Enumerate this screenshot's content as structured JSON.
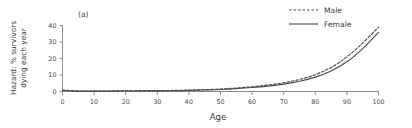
{
  "panel": {
    "label": "(a)"
  },
  "legend": {
    "position": "top-right",
    "entries": [
      {
        "label": "Male",
        "style": "dashed"
      },
      {
        "label": "Female",
        "style": "solid"
      }
    ]
  },
  "axes": {
    "x": {
      "title": "Age",
      "ticks": [
        "0",
        "10",
        "20",
        "30",
        "40",
        "50",
        "60",
        "70",
        "80",
        "90",
        "100"
      ],
      "min": 0,
      "max": 100
    },
    "y": {
      "title_line1": "Hazard: % survivors",
      "title_line2": "dying each year",
      "ticks": [
        "0",
        "10",
        "20",
        "30",
        "40"
      ],
      "min": 0,
      "max": 40
    }
  },
  "colors": {
    "line": "#4d4d4d",
    "axis": "#8c8c8c",
    "text": "#3a3a3a",
    "background": "#ffffff"
  },
  "chart_data": {
    "type": "line",
    "title": "(a)",
    "xlabel": "Age",
    "ylabel": "Hazard: % survivors dying each year",
    "xlim": [
      0,
      100
    ],
    "ylim": [
      0,
      40
    ],
    "grid": false,
    "legend_position": "top-right",
    "x": [
      0,
      5,
      10,
      15,
      20,
      25,
      30,
      35,
      40,
      45,
      50,
      55,
      60,
      65,
      70,
      75,
      80,
      85,
      90,
      95,
      100
    ],
    "series": [
      {
        "name": "Male",
        "style": "dashed",
        "values": [
          0.8,
          0.3,
          0.25,
          0.3,
          0.45,
          0.5,
          0.55,
          0.65,
          0.85,
          1.1,
          1.5,
          2.1,
          2.9,
          3.9,
          5.3,
          7.3,
          10.2,
          14.6,
          21.0,
          29.4,
          39.0
        ]
      },
      {
        "name": "Female",
        "style": "solid",
        "values": [
          0.7,
          0.25,
          0.2,
          0.22,
          0.28,
          0.32,
          0.38,
          0.48,
          0.65,
          0.9,
          1.2,
          1.7,
          2.4,
          3.3,
          4.5,
          6.2,
          8.7,
          12.4,
          18.0,
          26.0,
          35.8
        ]
      }
    ]
  }
}
